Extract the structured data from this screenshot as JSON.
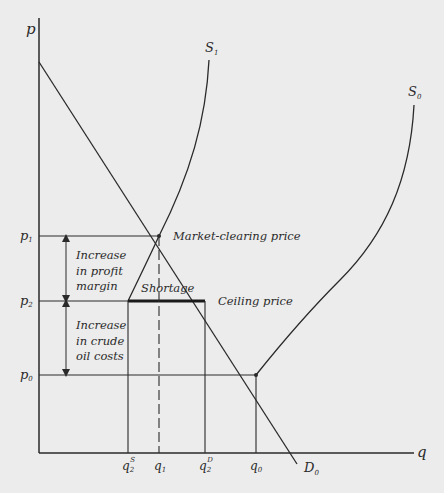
{
  "diagram": {
    "type": "supply-demand with price ceiling",
    "axes": {
      "y_label": "p",
      "x_label": "q"
    },
    "price_ticks": [
      {
        "id": "p1",
        "base": "p",
        "sub": "1"
      },
      {
        "id": "p2",
        "base": "p",
        "sub": "2"
      },
      {
        "id": "p0",
        "base": "p",
        "sub": "0"
      }
    ],
    "quantity_ticks": [
      {
        "id": "q2S",
        "base": "q",
        "sub": "2",
        "sup": "S"
      },
      {
        "id": "q1",
        "base": "q",
        "sub": "1"
      },
      {
        "id": "q2D",
        "base": "q",
        "sub": "2",
        "sup": "D"
      },
      {
        "id": "q0",
        "base": "q",
        "sub": "0"
      }
    ],
    "curves": {
      "S1": {
        "base": "S",
        "sub": "1"
      },
      "S0": {
        "base": "S",
        "sub": "0"
      },
      "D0": {
        "base": "D",
        "sub": "0"
      }
    },
    "annotations": {
      "market_clearing": "Market-clearing price",
      "ceiling": "Ceiling price",
      "shortage": "Shortage",
      "profit_margin": [
        "Increase",
        "in profit",
        "margin"
      ],
      "crude_oil": [
        "Increase",
        "in crude",
        "oil costs"
      ]
    },
    "colors": {
      "line": "#2a2a2a",
      "background": "#ececec"
    }
  }
}
